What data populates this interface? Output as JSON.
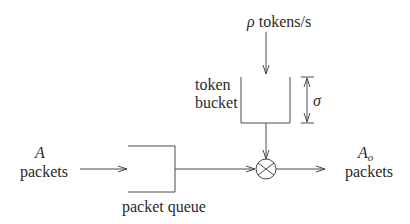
{
  "diagram": {
    "rate_label": {
      "symbol": "ρ",
      "text": " tokens/s"
    },
    "bucket_label": {
      "line1": "token",
      "line2": "bucket"
    },
    "bucket_size_symbol": "σ",
    "input_label": {
      "symbol": "A",
      "text": "packets"
    },
    "output_label": {
      "symbol": "A",
      "subscript": "o",
      "text": "packets"
    },
    "queue_label": "packet queue",
    "colors": {
      "line": "#4a4a4a",
      "text": "#2a2a2a",
      "background": "#ffffff"
    }
  }
}
